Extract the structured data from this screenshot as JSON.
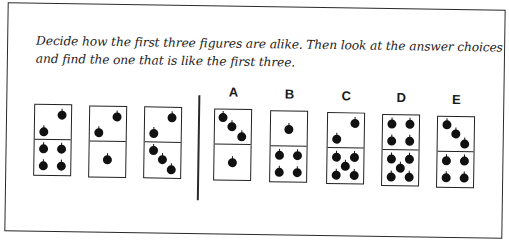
{
  "instructions": {
    "line1": "Decide how the first three figures are alike. Then look at the answer choices",
    "line2": "and find the one that is like the first three."
  },
  "examples": [
    {
      "id": "example-1",
      "top_pips": 2,
      "bottom_pips": 4
    },
    {
      "id": "example-2",
      "top_pips": 2,
      "bottom_pips": 1
    },
    {
      "id": "example-3",
      "top_pips": 2,
      "bottom_pips": 3
    }
  ],
  "choices": [
    {
      "label": "A",
      "top_pips": 3,
      "bottom_pips": 1
    },
    {
      "label": "B",
      "top_pips": 1,
      "bottom_pips": 4
    },
    {
      "label": "C",
      "top_pips": 2,
      "bottom_pips": 5
    },
    {
      "label": "D",
      "top_pips": 4,
      "bottom_pips": 5
    },
    {
      "label": "E",
      "top_pips": 3,
      "bottom_pips": 4
    }
  ],
  "pip_icon": "apple-dot-icon"
}
